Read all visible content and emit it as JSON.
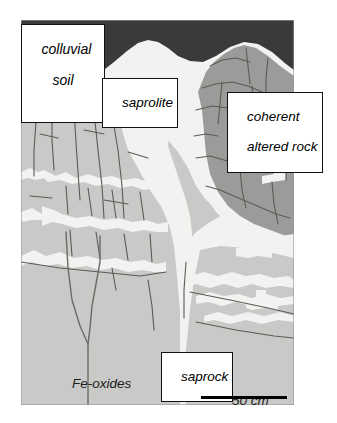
{
  "figure": {
    "type": "geological-cross-section-diagram",
    "frame": {
      "x": 21,
      "y": 20,
      "width": 273,
      "height": 385
    }
  },
  "labels": {
    "colluvial_soil": {
      "line1": "colluvial",
      "line2": "soil",
      "boxed": true
    },
    "saprolite": {
      "text": "saprolite",
      "boxed": true
    },
    "coherent_altered_rock": {
      "line1": "coherent",
      "line2": "altered rock",
      "boxed": true
    },
    "saprock": {
      "text": "saprock",
      "boxed": true
    },
    "fe_oxides": {
      "text": "Fe-oxides",
      "boxed": false
    }
  },
  "scale": {
    "text": "50 cm",
    "bar_length_px": 86
  },
  "colors": {
    "colluvial_soil": "#3a3a3a",
    "saprolite": "#f2f2f0",
    "saprock": "#c9c9c7",
    "coherent_altered_rock": "#9b9b99",
    "fracture_line": "#5a5a58",
    "outline": "#111111",
    "label_text": "#000000",
    "background": "#ffffff"
  },
  "units": {
    "colluvial_soil": "colluvial soil",
    "saprolite": "saprolite",
    "saprock": "saprock",
    "coherent_altered_rock": "coherent altered rock"
  }
}
